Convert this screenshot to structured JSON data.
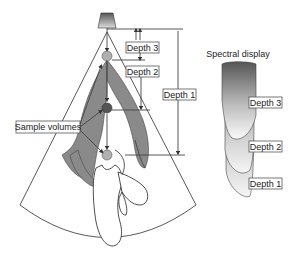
{
  "diagram": {
    "depth_labels": [
      "Depth 3",
      "Depth 2",
      "Depth 1"
    ],
    "sample_volumes_label": "Sample volumes",
    "spectral_title": "Spectral display",
    "spectral_labels": [
      "Depth 3",
      "Depth 2",
      "Depth 1"
    ],
    "colors": {
      "tissue": "#8a8a8a",
      "sample_volume_light": "#b0b0b0",
      "sample_volume_dark": "#555555",
      "line": "#444444"
    }
  }
}
